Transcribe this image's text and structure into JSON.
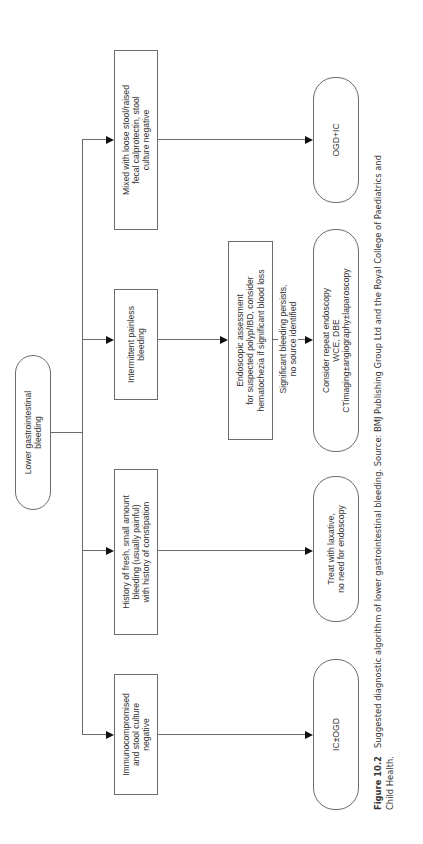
{
  "diagram": {
    "root": "Lower gastrointestinal\nbleeding",
    "branches": [
      {
        "condition": "Immunocompromised\nand stool culture\nnegative",
        "outcome": "IC±OGD"
      },
      {
        "condition": "History of fresh, small amount\nbleeding (usually painful)\nwith history of constipation",
        "outcome": "Treat with laxative,\nno need for endoscopy"
      },
      {
        "condition": "Intermittent painless\nbleeding",
        "intermediate": "Endoscopic assessment\nfor suspected polyp/IBD, consider\nhematochezia if significant blood loss",
        "edge_label": "Significant bleeding persists,\nno source identified",
        "outcome": "Consider repeat endoscopy\nWCE, DBE\nCTimaging±angiography±laparoscopy"
      },
      {
        "condition": "Mixed with loose stool/raised\nfecal calprotectin, stool\nculture negative",
        "outcome": "OGD+IC"
      }
    ]
  },
  "caption": {
    "label": "Figure 10.2",
    "text": "Suggested diagnostic algorithm of lower gastrointestinal bleeding. Source: BMJ Publishing Group Ltd and the Royal College of Paediatrics and",
    "text_line2": "Child Health."
  },
  "colors": {
    "line": "#6b6b6b",
    "arrowhead": "#111111",
    "text": "#333333",
    "background": "#ffffff"
  }
}
